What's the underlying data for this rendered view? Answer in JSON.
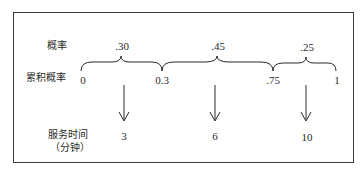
{
  "labels": {
    "probability": "概率",
    "cumulative_probability": "累积概率",
    "service_time": "服务时间",
    "service_time_unit": "（分钟）"
  },
  "segments": [
    {
      "probability": ".30",
      "start": "0",
      "end": "0.3",
      "service_time": "3"
    },
    {
      "probability": ".45",
      "start": "0.3",
      "end": ".75",
      "service_time": "6"
    },
    {
      "probability": ".25",
      "start": ".75",
      "end": "1",
      "service_time": "10"
    }
  ],
  "ticks": [
    "0",
    "0.3",
    ".75",
    "1"
  ],
  "colors": {
    "line": "#2a2a2a",
    "background": "#ffffff"
  }
}
